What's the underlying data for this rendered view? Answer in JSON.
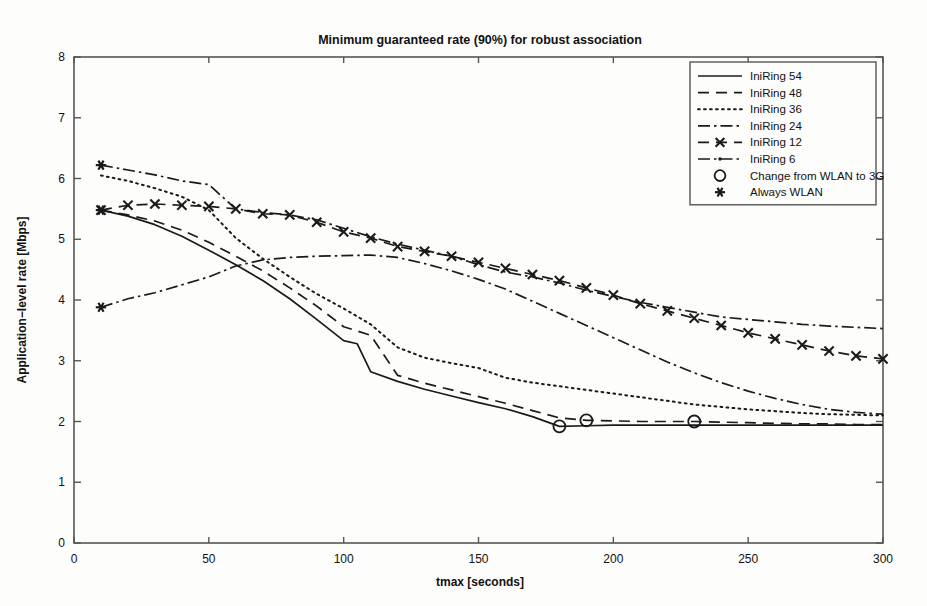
{
  "chart_data": {
    "type": "line",
    "title": "Minimum guaranteed rate (90%) for robust association",
    "xlabel": "tmax [seconds]",
    "ylabel": "Application-level rate [Mbps]",
    "xlim": [
      0,
      300
    ],
    "ylim": [
      0,
      8
    ],
    "xticks": [
      0,
      50,
      100,
      150,
      200,
      250,
      300
    ],
    "yticks": [
      0,
      1,
      2,
      3,
      4,
      5,
      6,
      7,
      8
    ],
    "grid": false,
    "legend_position": "top-right",
    "series": [
      {
        "name": "IniRing 54",
        "style": "solid",
        "marker": "none",
        "x": [
          10,
          20,
          30,
          40,
          50,
          60,
          70,
          80,
          90,
          100,
          105,
          110,
          120,
          130,
          140,
          150,
          160,
          170,
          180,
          190,
          200,
          210,
          220,
          230,
          240,
          250,
          260,
          270,
          280,
          290,
          300
        ],
        "y": [
          5.48,
          5.38,
          5.24,
          5.05,
          4.82,
          4.58,
          4.32,
          4.02,
          3.68,
          3.33,
          3.28,
          2.82,
          2.66,
          2.53,
          2.42,
          2.31,
          2.21,
          2.08,
          1.92,
          1.93,
          1.94,
          1.94,
          1.94,
          1.94,
          1.94,
          1.94,
          1.94,
          1.94,
          1.94,
          1.94,
          1.94
        ]
      },
      {
        "name": "IniRing 48",
        "style": "dashed",
        "marker": "none",
        "x": [
          10,
          20,
          30,
          40,
          50,
          60,
          70,
          80,
          90,
          100,
          110,
          120,
          130,
          140,
          150,
          160,
          170,
          180,
          190,
          200,
          210,
          220,
          230,
          240,
          250,
          260,
          270,
          280,
          290,
          300
        ],
        "y": [
          5.48,
          5.4,
          5.3,
          5.15,
          4.95,
          4.72,
          4.48,
          4.2,
          3.9,
          3.56,
          3.42,
          2.76,
          2.63,
          2.52,
          2.41,
          2.3,
          2.18,
          2.06,
          2.02,
          2.01,
          2.0,
          2.0,
          2.0,
          1.99,
          1.98,
          1.97,
          1.96,
          1.96,
          1.95,
          1.95
        ]
      },
      {
        "name": "IniRing 36",
        "style": "dotted",
        "marker": "none",
        "x": [
          10,
          20,
          30,
          40,
          50,
          60,
          70,
          80,
          90,
          100,
          110,
          120,
          130,
          140,
          150,
          160,
          170,
          180,
          190,
          200,
          210,
          220,
          230,
          240,
          250,
          260,
          270,
          280,
          290,
          300
        ],
        "y": [
          6.05,
          5.96,
          5.84,
          5.7,
          5.48,
          5.02,
          4.68,
          4.38,
          4.1,
          3.86,
          3.6,
          3.22,
          3.05,
          2.96,
          2.88,
          2.72,
          2.64,
          2.58,
          2.52,
          2.46,
          2.4,
          2.34,
          2.28,
          2.24,
          2.2,
          2.17,
          2.14,
          2.12,
          2.11,
          2.1
        ]
      },
      {
        "name": "IniRing 24",
        "style": "dashdot",
        "marker": "none",
        "x": [
          10,
          20,
          30,
          40,
          50,
          60,
          70,
          80,
          90,
          100,
          110,
          120,
          130,
          140,
          150,
          160,
          170,
          180,
          190,
          200,
          210,
          220,
          230,
          240,
          250,
          260,
          270,
          280,
          290,
          300
        ],
        "y": [
          3.88,
          4.02,
          4.12,
          4.25,
          4.38,
          4.56,
          4.66,
          4.7,
          4.72,
          4.73,
          4.74,
          4.7,
          4.6,
          4.48,
          4.34,
          4.18,
          3.98,
          3.78,
          3.58,
          3.38,
          3.18,
          2.98,
          2.8,
          2.64,
          2.5,
          2.38,
          2.28,
          2.2,
          2.15,
          2.12
        ]
      },
      {
        "name": "IniRing 12",
        "style": "dashed",
        "marker": "x",
        "x": [
          10,
          20,
          30,
          40,
          50,
          60,
          70,
          80,
          90,
          100,
          110,
          120,
          130,
          140,
          150,
          160,
          170,
          180,
          190,
          200,
          210,
          220,
          230,
          240,
          250,
          260,
          270,
          280,
          290,
          300
        ],
        "y": [
          5.48,
          5.56,
          5.58,
          5.56,
          5.54,
          5.5,
          5.42,
          5.4,
          5.28,
          5.12,
          5.02,
          4.88,
          4.8,
          4.72,
          4.62,
          4.52,
          4.42,
          4.32,
          4.2,
          4.08,
          3.94,
          3.82,
          3.7,
          3.58,
          3.46,
          3.36,
          3.26,
          3.16,
          3.08,
          3.03
        ]
      },
      {
        "name": "IniRing 6",
        "style": "dashdot",
        "marker": "none",
        "x": [
          10,
          20,
          30,
          40,
          50,
          60,
          70,
          80,
          90,
          100,
          110,
          120,
          130,
          140,
          150,
          160,
          170,
          180,
          190,
          200,
          210,
          220,
          230,
          240,
          250,
          260,
          270,
          280,
          290,
          300
        ],
        "y": [
          6.22,
          6.14,
          6.06,
          5.96,
          5.9,
          5.5,
          5.44,
          5.4,
          5.32,
          5.18,
          5.04,
          4.92,
          4.82,
          4.72,
          4.58,
          4.46,
          4.38,
          4.28,
          4.16,
          4.06,
          3.96,
          3.88,
          3.8,
          3.72,
          3.68,
          3.64,
          3.6,
          3.57,
          3.55,
          3.53
        ]
      }
    ],
    "markers": {
      "always_wlan": [
        {
          "x": 10,
          "y": 6.22
        },
        {
          "x": 10,
          "y": 5.48
        },
        {
          "x": 10,
          "y": 3.88
        }
      ],
      "change_wlan_to_3g": [
        {
          "x": 180,
          "y": 1.92
        },
        {
          "x": 190,
          "y": 2.02
        },
        {
          "x": 230,
          "y": 2.0
        }
      ]
    },
    "legend": [
      {
        "label": "IniRing 54",
        "style": "solid",
        "marker": "none"
      },
      {
        "label": "IniRing 48",
        "style": "dashed",
        "marker": "none"
      },
      {
        "label": "IniRing 36",
        "style": "dotted",
        "marker": "none"
      },
      {
        "label": "IniRing 24",
        "style": "dashdot",
        "marker": "none"
      },
      {
        "label": "IniRing 12",
        "style": "dashed",
        "marker": "x"
      },
      {
        "label": "IniRing 6",
        "style": "dashdot",
        "marker": "dot"
      },
      {
        "label": "Change from WLAN to 3G",
        "style": "none",
        "marker": "circle"
      },
      {
        "label": "Always WLAN",
        "style": "none",
        "marker": "asterisk"
      }
    ],
    "colors": {
      "line": "#1a1a1a",
      "axis": "#555555",
      "background": "#fdfdfc"
    }
  }
}
